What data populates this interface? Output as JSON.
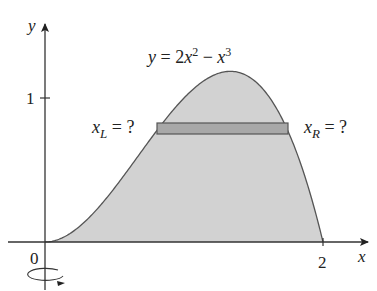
{
  "figure": {
    "curve_equation": {
      "y": "y",
      "eq": " = 2",
      "x1": "x",
      "exp1": "2",
      "minus": " − ",
      "x2": "x",
      "exp2": "3"
    },
    "axes": {
      "x_label": "x",
      "y_label": "y",
      "origin_label": "0",
      "x_tick_label": "2",
      "y_tick_label": "1"
    },
    "left_label": {
      "var": "x",
      "sub": "L",
      "rest": " = ?"
    },
    "right_label": {
      "var": "x",
      "sub": "R",
      "rest": " = ?"
    },
    "rotation_indicator": "rotation about y-axis",
    "colors": {
      "region_fill": "#d2d2d2",
      "strip_fill": "#a8a8a8",
      "stroke": "#555555",
      "axis": "#333333"
    }
  }
}
